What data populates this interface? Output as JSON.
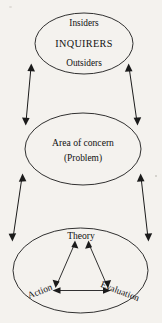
{
  "diagram": {
    "background_color": "#f4f2ee",
    "stroke_color": "#1b1b1b",
    "nodes": {
      "inquirers": {
        "line1": "Insiders",
        "line2": "INQUIRERS",
        "line3": "Outsiders"
      },
      "concern": {
        "line1": "Area of concern",
        "line2": "(Problem)"
      },
      "cycle": {
        "theory": "Theory",
        "action": "Action",
        "evaluation": "Evaluation"
      }
    },
    "connectors": [
      {
        "name": "inquirers-concern-left",
        "style": "double-headed"
      },
      {
        "name": "inquirers-concern-right",
        "style": "double-headed"
      },
      {
        "name": "concern-cycle-left",
        "style": "double-headed"
      },
      {
        "name": "concern-cycle-right",
        "style": "double-headed"
      }
    ],
    "cycle_links": [
      {
        "name": "action-theory",
        "style": "double-headed"
      },
      {
        "name": "theory-evaluation",
        "style": "double-headed"
      },
      {
        "name": "action-evaluation",
        "style": "double-headed"
      }
    ]
  }
}
